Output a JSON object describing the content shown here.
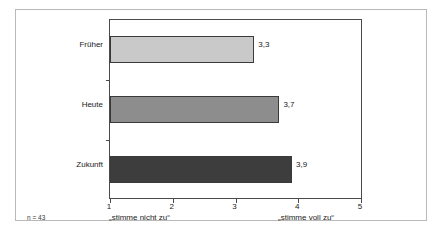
{
  "chart_data": {
    "type": "bar",
    "orientation": "horizontal",
    "title": "",
    "subtitle": "",
    "categories": [
      "Früher",
      "Heute",
      "Zukunft"
    ],
    "values": [
      3.3,
      3.7,
      3.9
    ],
    "value_labels": [
      "3,3",
      "3,7",
      "3,9"
    ],
    "series": [
      {
        "name": "",
        "values": [
          3.3,
          3.7,
          3.9
        ]
      }
    ],
    "xlabel": "",
    "ylabel": "",
    "xlim": [
      1,
      5
    ],
    "xticks": [
      1,
      2,
      3,
      4,
      5
    ],
    "xtick_labels": [
      "1",
      "2",
      "3",
      "4",
      "5"
    ],
    "grid": false,
    "legend": false,
    "legend_position": "none",
    "bar_colors": [
      "#c9c9c9",
      "#8d8d8d",
      "#3d3d3d"
    ],
    "bar_border_color": "#3a3a3a",
    "axis_color": "#4a4a4a",
    "frame_color": "#b9b9b9",
    "annotations": {
      "scale_low": "„stimme nicht zu“",
      "scale_high": "„stimme voll zu“",
      "sample_size": "n = 43"
    }
  }
}
